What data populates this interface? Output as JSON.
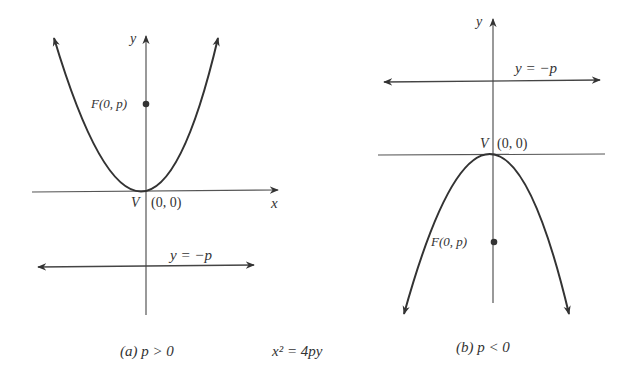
{
  "figure": {
    "equation": "x² = 4py",
    "panels": [
      {
        "id": "a",
        "caption": "(a)  p > 0",
        "axis_labels": {
          "y": "y",
          "x": "x"
        },
        "focus_label": "F(0, p)",
        "vertex_label": "V",
        "vertex_coords": "(0, 0)",
        "directrix_label": "y = −p",
        "opens": "up"
      },
      {
        "id": "b",
        "caption": "(b)  p < 0",
        "axis_labels": {
          "y": "y"
        },
        "focus_label": "F(0, p)",
        "vertex_label": "V",
        "vertex_coords": "(0, 0)",
        "directrix_label": "y = −p",
        "opens": "down"
      }
    ]
  },
  "colors": {
    "ink": "#333333",
    "background": "#ffffff"
  }
}
